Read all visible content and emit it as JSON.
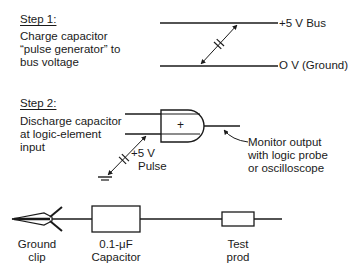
{
  "step1": {
    "title": "Step 1:",
    "lines": [
      "Charge capacitor",
      "“pulse generator” to",
      "bus voltage"
    ],
    "bus_top_label": "+5 V Bus",
    "bus_bottom_label": "O V (Ground)"
  },
  "step2": {
    "title": "Step 2:",
    "lines": [
      "Discharge capacitor",
      "at logic-element",
      "input"
    ],
    "gate_symbol": "+",
    "pulse_label_1": "+5 V",
    "pulse_label_2": "Pulse",
    "monitor_lines": [
      "Monitor output",
      "with logic probe",
      "or oscilloscope"
    ]
  },
  "probe": {
    "ground_clip_label_1": "Ground",
    "ground_clip_label_2": "clip",
    "capacitor_label_1": "0.1-μF",
    "capacitor_label_2": "Capacitor",
    "test_prod_label_1": "Test",
    "test_prod_label_2": "prod"
  },
  "colors": {
    "ink": "#1a1a1a",
    "background": "#ffffff"
  }
}
